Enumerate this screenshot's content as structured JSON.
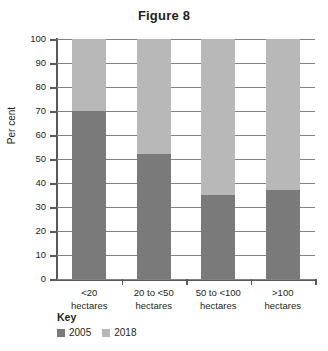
{
  "chart_data": {
    "type": "bar",
    "subtype": "stacked-100",
    "title": "Figure 8",
    "xlabel": "",
    "ylabel": "Per cent",
    "ylim": [
      0,
      100
    ],
    "yticks": [
      0,
      10,
      20,
      30,
      40,
      50,
      60,
      70,
      80,
      90,
      100
    ],
    "grid": true,
    "legend_position": "bottom-left",
    "legend_title": "Key",
    "categories": [
      "<20 hectares",
      "20 to <50 hectares",
      "50 to <100 hectares",
      ">100 hectares"
    ],
    "category_lines": [
      [
        "<20",
        "hectares"
      ],
      [
        "20 to <50",
        "hectares"
      ],
      [
        "50 to <100",
        "hectares"
      ],
      [
        ">100",
        "hectares"
      ]
    ],
    "series": [
      {
        "name": "2005",
        "color": "#7a7a7a",
        "values": [
          70,
          52,
          35,
          37
        ]
      },
      {
        "name": "2018",
        "color": "#b8b8b8",
        "values": [
          30,
          48,
          65,
          63
        ]
      }
    ]
  },
  "colors": {
    "series_2005": "#7a7a7a",
    "series_2018": "#b8b8b8",
    "axis": "#58595b",
    "grid": "#808285",
    "text": "#231f20",
    "background": "#ffffff"
  }
}
